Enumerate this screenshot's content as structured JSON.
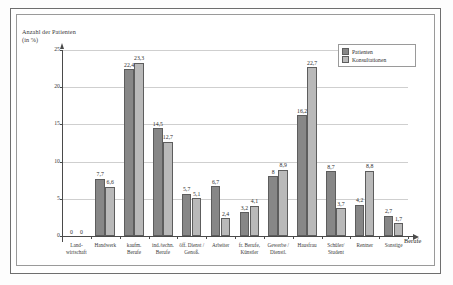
{
  "chart": {
    "ytitle": "Anzahl der Patienten (in %)",
    "xtitle": "Berufe"
  },
  "legend": {
    "items": [
      {
        "label": "Patienten",
        "color": "#878787"
      },
      {
        "label": "Konsultationen",
        "color": "#b9b9b9"
      }
    ]
  },
  "chart_data": {
    "type": "bar",
    "title": "",
    "xlabel": "Berufe",
    "ylabel": "Anzahl der Patienten (in %)",
    "ylim": [
      0,
      25
    ],
    "yticks": [
      0,
      5,
      10,
      15,
      20,
      25
    ],
    "ytick_labels": [
      "0",
      "5",
      "10",
      "15",
      "20",
      "25"
    ],
    "grid": true,
    "legend_position": "top-right",
    "decimal_separator": ",",
    "categories": [
      "Land-\nwirtschaft",
      "Handwerk",
      "kaufm.\nBerufe",
      "ind./techn.\nBerufe",
      "öff. Dienst /\nGenoß.",
      "Arbeiter",
      "fr. Berufe,\nKünstler",
      "Gewerbe /\nDienstl.",
      "Hausfrau",
      "Schüler/\nStudent",
      "Rentner",
      "Sonstige"
    ],
    "series": [
      {
        "name": "Patienten",
        "color": "#878787",
        "values": [
          0,
          7.7,
          22.4,
          14.5,
          5.7,
          6.7,
          3.2,
          8,
          16.2,
          8.7,
          4.2,
          2.7
        ],
        "labels": [
          "0",
          "7,7",
          "22,4",
          "14,5",
          "5,7",
          "6,7",
          "3,2",
          "8",
          "16,2",
          "8,7",
          "4,2",
          "2,7"
        ]
      },
      {
        "name": "Konsultationen",
        "color": "#b9b9b9",
        "values": [
          0,
          6.6,
          23.3,
          12.7,
          5.1,
          2.4,
          4.1,
          8.9,
          22.7,
          3.7,
          8.8,
          1.7
        ],
        "labels": [
          "0",
          "6,6",
          "23,3",
          "12,7",
          "5,1",
          "2,4",
          "4,1",
          "8,9",
          "22,7",
          "3,7",
          "8,8",
          "1,7"
        ]
      }
    ]
  }
}
